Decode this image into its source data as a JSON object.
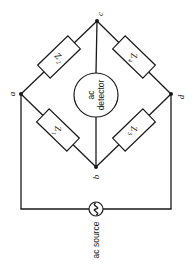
{
  "diagram": {
    "nodes": {
      "a": "a",
      "b": "b",
      "c": "c",
      "d": "d"
    },
    "impedances": {
      "z1": {
        "label": "Z",
        "sub": "1",
        "between": [
          "a",
          "b"
        ]
      },
      "z2": {
        "label": "Z",
        "sub": "2",
        "between": [
          "a",
          "c"
        ]
      },
      "z3": {
        "label": "Z",
        "sub": "3",
        "between": [
          "b",
          "d"
        ]
      },
      "z4": {
        "label": "Z",
        "sub": "4",
        "between": [
          "c",
          "d"
        ]
      }
    },
    "detector": {
      "line1": "ac",
      "line2": "detector",
      "between": [
        "c",
        "b"
      ]
    },
    "source": {
      "label": "ac source",
      "symbol": "~",
      "between": [
        "a",
        "d"
      ]
    }
  }
}
